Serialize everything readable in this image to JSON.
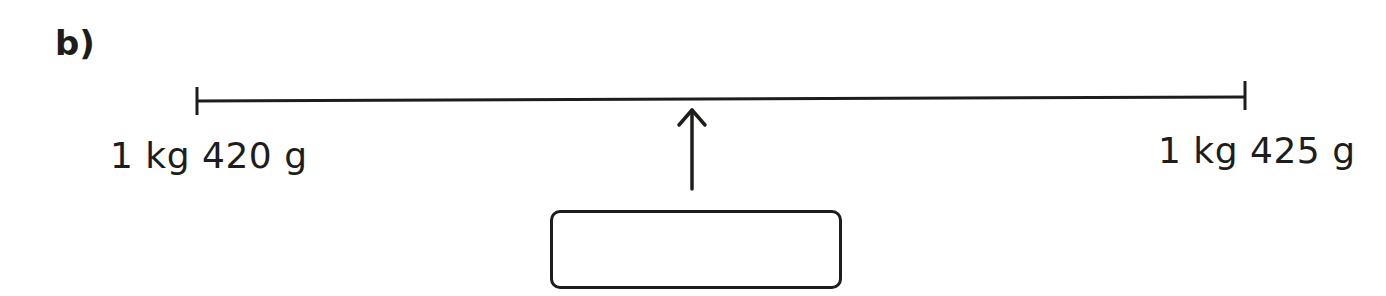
{
  "question": {
    "part_label": "b)"
  },
  "number_line": {
    "start_label": "1 kg 420 g",
    "end_label": "1 kg 425 g",
    "start_value_g": 1420,
    "end_value_g": 1425,
    "arrow": "up-arrow-icon",
    "arrow_position_fraction": 0.47
  },
  "answer_box": {
    "value": ""
  },
  "colors": {
    "ink": "#1d1d1b",
    "background": "#ffffff"
  }
}
